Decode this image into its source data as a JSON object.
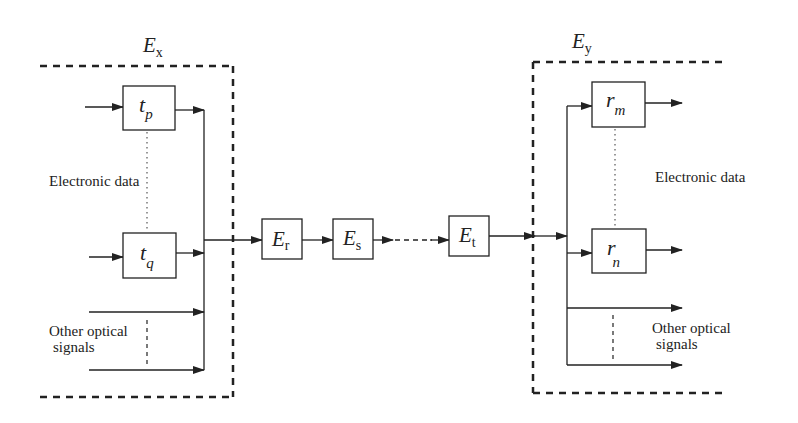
{
  "diagram": {
    "left_group": {
      "label": "E",
      "label_sub": "x",
      "tx_top": {
        "sym": "t",
        "sub": "p"
      },
      "tx_bottom": {
        "sym": "t",
        "sub": "q"
      },
      "electronic_label": "Electronic data",
      "optical_label_line1": "Other optical",
      "optical_label_line2": "signals"
    },
    "chain": [
      {
        "sym": "E",
        "sub": "r"
      },
      {
        "sym": "E",
        "sub": "s"
      },
      {
        "sym": "E",
        "sub": "t"
      }
    ],
    "right_group": {
      "label": "E",
      "label_sub": "y",
      "rx_top": {
        "sym": "r",
        "sub": "m"
      },
      "rx_bottom": {
        "sym": "r",
        "sub": "n"
      },
      "electronic_label": "Electronic data",
      "optical_label_line1": "Other optical",
      "optical_label_line2": "signals"
    },
    "colors": {
      "line": "#222222",
      "background": "#ffffff"
    }
  }
}
